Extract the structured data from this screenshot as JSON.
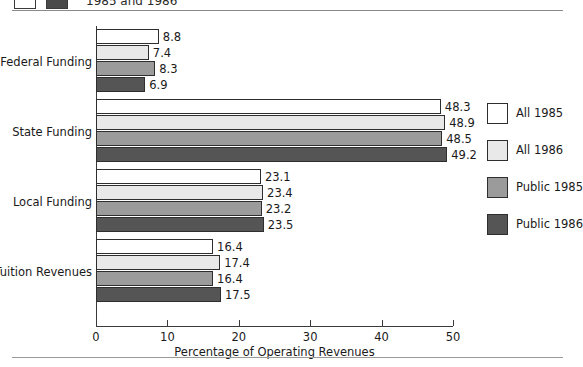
{
  "figure": {
    "cutoff_title": "1985 and 1986",
    "cutoff_swatch_light": "white-swatch-icon",
    "cutoff_swatch_dark": "dark-swatch-icon"
  },
  "chart_data": {
    "type": "bar",
    "orientation": "horizontal",
    "title": "1985 and 1986",
    "xlabel": "Percentage of Operating Revenues",
    "ylabel": "",
    "xlim": [
      0,
      50
    ],
    "xticks": [
      0,
      10,
      20,
      30,
      40,
      50
    ],
    "xticklabels": [
      "0",
      "10",
      "20",
      "30",
      "40",
      "50"
    ],
    "grid": false,
    "legend_position": "right",
    "categories": [
      "Federal Funding",
      "State Funding",
      "Local Funding",
      "Tuition Revenues"
    ],
    "series": [
      {
        "name": "All 1985",
        "color": "#ffffff",
        "values": [
          8.8,
          48.3,
          23.1,
          16.4
        ]
      },
      {
        "name": "All 1986",
        "color": "#e9e9e9",
        "values": [
          7.4,
          48.9,
          23.4,
          17.4
        ]
      },
      {
        "name": "Public 1985",
        "color": "#9b9b9b",
        "values": [
          8.3,
          48.5,
          23.2,
          16.4
        ]
      },
      {
        "name": "Public 1986",
        "color": "#555555",
        "values": [
          6.9,
          49.2,
          23.5,
          17.5
        ]
      }
    ],
    "value_labels": [
      [
        "8.8",
        "7.4",
        "8.3",
        "6.9"
      ],
      [
        "48.3",
        "48.9",
        "48.5",
        "49.2"
      ],
      [
        "23.1",
        "23.4",
        "23.2",
        "23.5"
      ],
      [
        "16.4",
        "17.4",
        "16.4",
        "17.5"
      ]
    ]
  }
}
